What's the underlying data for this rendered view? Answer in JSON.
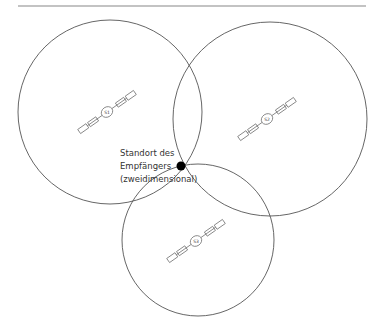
{
  "diagram": {
    "top_rule": {
      "x1": 18,
      "x2": 366,
      "y": 6,
      "color": "#888888"
    },
    "circles": [
      {
        "id": "S1",
        "cx": 110,
        "cy": 112,
        "r": 92
      },
      {
        "id": "S2",
        "cx": 270,
        "cy": 119,
        "r": 97
      },
      {
        "id": "S3",
        "cx": 198,
        "cy": 240,
        "r": 76
      }
    ],
    "satellites": [
      {
        "label": "S1",
        "x": 107,
        "y": 112
      },
      {
        "label": "S2",
        "x": 267,
        "y": 119
      },
      {
        "label": "S3",
        "x": 196,
        "y": 241
      }
    ],
    "receiver": {
      "x": 181,
      "y": 166,
      "r": 4.5
    },
    "label": {
      "line1": "Standort des",
      "line2": "Empfängers",
      "line3": "(zweidimensional)"
    },
    "colors": {
      "stroke": "#555555",
      "dot": "#000000",
      "text": "#333333"
    }
  }
}
